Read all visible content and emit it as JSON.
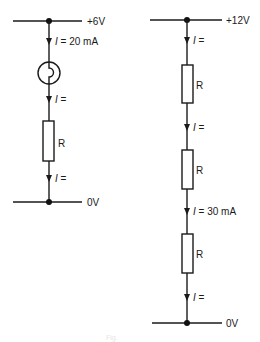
{
  "diagram": {
    "type": "series circuit diagrams",
    "colors": {
      "ink": "#1a1a1a",
      "background": "#ffffff"
    },
    "left_circuit": {
      "supply_label": "+6V",
      "ground_label": "0V",
      "components": [
        {
          "kind": "current",
          "label": "I = 20 mA",
          "symbol": "I",
          "value": "= 20 mA"
        },
        {
          "kind": "lamp"
        },
        {
          "kind": "current",
          "label": "I =",
          "symbol": "I",
          "value": "="
        },
        {
          "kind": "resistor",
          "label": "R"
        },
        {
          "kind": "current",
          "label": "I =",
          "symbol": "I",
          "value": "="
        }
      ]
    },
    "right_circuit": {
      "supply_label": "+12V",
      "ground_label": "0V",
      "components": [
        {
          "kind": "current",
          "label": "I =",
          "symbol": "I",
          "value": "="
        },
        {
          "kind": "resistor",
          "label": "R"
        },
        {
          "kind": "current",
          "label": "I =",
          "symbol": "I",
          "value": "="
        },
        {
          "kind": "resistor",
          "label": "R"
        },
        {
          "kind": "current",
          "label": "I = 30 mA",
          "symbol": "I",
          "value": "= 30 mA"
        },
        {
          "kind": "resistor",
          "label": "R"
        },
        {
          "kind": "current",
          "label": "I =",
          "symbol": "I",
          "value": "="
        }
      ]
    },
    "caption": "Fig."
  }
}
